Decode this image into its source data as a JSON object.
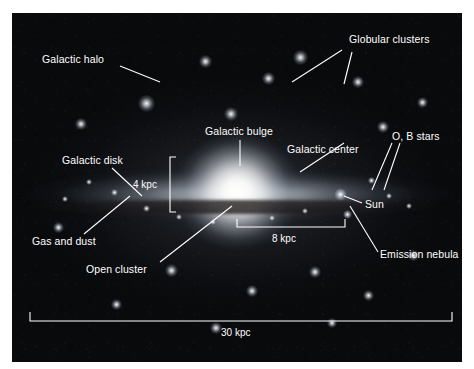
{
  "figure": {
    "background_color": "#ffffff",
    "plate_color": "#090a0c",
    "label_color": "#ffffff",
    "leader_color": "#ffffff"
  },
  "labels": {
    "galactic_halo": "Galactic halo",
    "globular_clusters": "Globular clusters",
    "galactic_bulge": "Galactic bulge",
    "galactic_center": "Galactic center",
    "ob_stars": "O, B stars",
    "galactic_disk": "Galactic disk",
    "gas_and_dust": "Gas and dust",
    "open_cluster": "Open cluster",
    "sun": "Sun",
    "emission_nebula": "Emission nebula"
  },
  "scale_bars": {
    "disk_thickness": "4 kpc",
    "sun_distance": "8 kpc",
    "galaxy_diameter": "30 kpc"
  }
}
